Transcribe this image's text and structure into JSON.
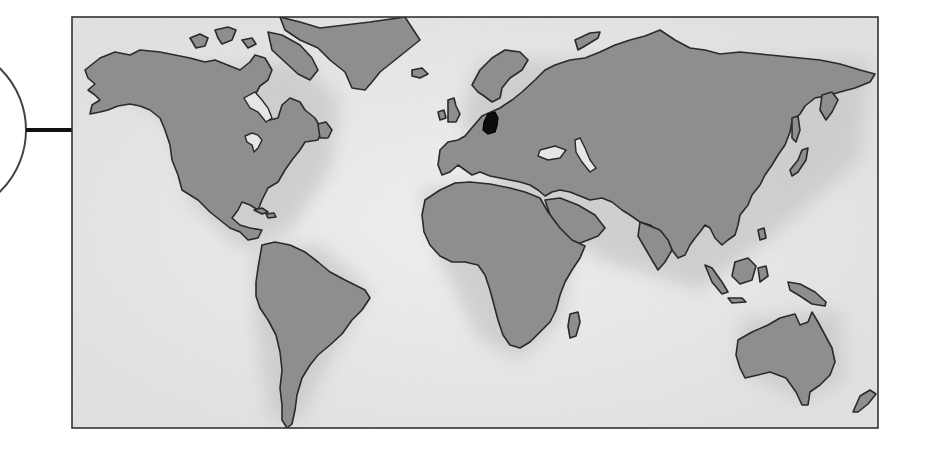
{
  "figure": {
    "type": "world-map-locator",
    "highlighted_region": "Germany",
    "colors": {
      "background": "#ffffff",
      "ocean": "#eeeeee",
      "ocean_shadow": "#d4d4d4",
      "land": "#8e8e8e",
      "coastline": "#2a2a2a",
      "highlight": "#0c0c0c",
      "frame": "#333333",
      "callout": "#444444"
    },
    "frame": {
      "x": 72,
      "y": 17,
      "width": 806,
      "height": 411
    },
    "callout": {
      "circle_cx": -60,
      "circle_cy": 130,
      "circle_r": 110,
      "connector_y": 130,
      "connector_x1": 26,
      "connector_x2": 72
    },
    "continents": [
      "North America",
      "South America",
      "Europe",
      "Africa",
      "Asia",
      "Australia",
      "Greenland"
    ]
  }
}
